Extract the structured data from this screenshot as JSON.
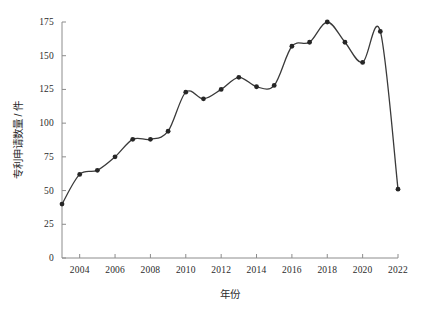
{
  "chart_data": {
    "type": "line",
    "title": "",
    "subtitle": "",
    "xlabel": "年份",
    "ylabel": "专利申请数量 / 件",
    "x": [
      2003,
      2004,
      2005,
      2006,
      2007,
      2008,
      2009,
      2010,
      2011,
      2012,
      2013,
      2014,
      2015,
      2016,
      2017,
      2018,
      2019,
      2020,
      2021,
      2022
    ],
    "values": [
      40,
      62,
      65,
      75,
      88,
      88,
      94,
      123,
      118,
      125,
      134,
      127,
      128,
      157,
      160,
      175,
      160,
      145,
      168,
      51
    ],
    "series": [
      {
        "name": "专利申请数量",
        "values": [
          40,
          62,
          65,
          75,
          88,
          88,
          94,
          123,
          118,
          125,
          134,
          127,
          128,
          157,
          160,
          175,
          160,
          145,
          168,
          51
        ]
      }
    ],
    "xlim": [
      2003,
      2022
    ],
    "ylim": [
      0,
      175
    ],
    "xticks": [
      2004,
      2006,
      2008,
      2010,
      2012,
      2014,
      2016,
      2018,
      2020,
      2022
    ],
    "xtick_labels": [
      "2004",
      "2006",
      "2008",
      "2010",
      "2012",
      "2014",
      "2016",
      "2018",
      "2020",
      "2022"
    ],
    "yticks": [
      0,
      25,
      50,
      75,
      100,
      125,
      150,
      175
    ],
    "ytick_labels": [
      "0",
      "25",
      "50",
      "75",
      "100",
      "125",
      "150",
      "175"
    ],
    "grid": false,
    "legend": false,
    "legend_position": "none",
    "line_color": "#3a3a3a",
    "marker_color": "#262626",
    "marker_shape": "circle",
    "axis_color": "#8c8c8c",
    "background_color": "#ffffff",
    "smoothing": "spline"
  }
}
